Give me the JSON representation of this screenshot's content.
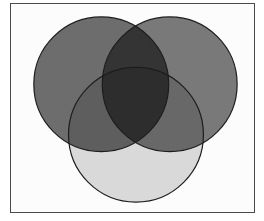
{
  "figure": {
    "kind": "venn-diagram",
    "title": "",
    "caption": "",
    "background_color": "#ffffff",
    "panel_background_color": "#fcfcfc",
    "frame": {
      "x": 10,
      "y": 3,
      "width": 245,
      "height": 210,
      "border_color": "#4a4a4a",
      "border_width": 1
    }
  },
  "chart_data": {
    "type": "venn",
    "title": "",
    "xlabel": "",
    "ylabel": "",
    "grid": false,
    "legend": "none",
    "set_count": 3,
    "viewbox": {
      "width": 245,
      "height": 210
    },
    "sets": [
      {
        "id": "set-left",
        "label": "",
        "cx": 91,
        "cy": 81,
        "r": 68,
        "fill": "#6e6e6e",
        "stroke": "#1c1c1c",
        "stroke_width": 1.2,
        "opacity": 1
      },
      {
        "id": "set-right",
        "label": "",
        "cx": 160,
        "cy": 81,
        "r": 68,
        "fill": "#7a7a7a",
        "stroke": "#1c1c1c",
        "stroke_width": 1.2,
        "opacity": 1
      },
      {
        "id": "set-bottom",
        "label": "",
        "cx": 126,
        "cy": 132,
        "r": 68,
        "fill": "#dcdcdc",
        "stroke": "#1c1c1c",
        "stroke_width": 1.2,
        "opacity": 1
      }
    ],
    "region_colors": {
      "left_only": "#6e6e6e",
      "right_only": "#7a7a7a",
      "bottom_only": "#dcdcdc",
      "left_and_right": "#2b2b2b",
      "left_and_bottom": "#3b3b3b",
      "right_and_bottom": "#3f3f3f",
      "all_three": "#0a0a0a"
    },
    "labels": []
  }
}
